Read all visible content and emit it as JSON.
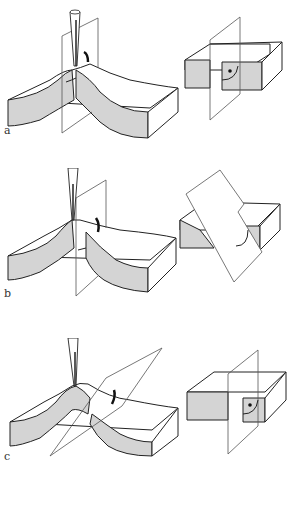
{
  "figure": {
    "panels": [
      {
        "id": "a",
        "label": "a",
        "description": "Pipette inserted at crest of curved slab; cutting plane perpendicular to slab; block section shows dot with right angle arc",
        "top": 0,
        "label_x": 4,
        "label_y": 132
      },
      {
        "id": "b",
        "label": "b",
        "description": "Pipette at side of crest; cutting plane vertical; block cut obliquely with arc",
        "top": 168,
        "label_x": 4,
        "label_y": 295
      },
      {
        "id": "c",
        "label": "c",
        "description": "Pipette at crest; cutting plane tilted diagonally; block section shows dot with right angle arc",
        "top": 338,
        "label_x": 4,
        "label_y": 455
      }
    ],
    "colors": {
      "section_fill": "#d4d4d4",
      "line": "#222222",
      "plane_line": "#555555",
      "background": "#ffffff"
    }
  }
}
